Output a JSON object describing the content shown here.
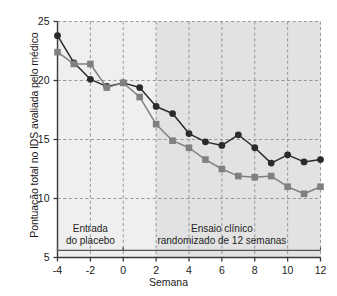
{
  "chart_data": {
    "type": "line",
    "title": "",
    "xlabel": "Semana",
    "ylabel": "Pontuação total no IDS avaliada pelo médico",
    "x": [
      -4,
      -3,
      -2,
      -1,
      0,
      1,
      2,
      3,
      4,
      5,
      6,
      7,
      8,
      9,
      10,
      11,
      12
    ],
    "xlim": [
      -4,
      12
    ],
    "ylim": [
      5,
      25
    ],
    "xticks": [
      "-4",
      "-2",
      "0",
      "2",
      "4",
      "6",
      "8",
      "10",
      "12"
    ],
    "xtick_values": [
      -4,
      -2,
      0,
      2,
      4,
      6,
      8,
      10,
      12
    ],
    "yticks": [
      "5",
      "10",
      "15",
      "20",
      "25"
    ],
    "ytick_values": [
      5,
      10,
      15,
      20,
      25
    ],
    "grid": true,
    "legend_position": "none",
    "series": [
      {
        "name": "circle-series",
        "marker": "circle",
        "color": "#2b2b2b",
        "values": [
          23.8,
          21.5,
          20.1,
          19.5,
          19.8,
          19.4,
          17.8,
          17.2,
          15.5,
          14.8,
          14.5,
          15.4,
          14.3,
          13.0,
          13.7,
          13.1,
          13.3
        ]
      },
      {
        "name": "square-series",
        "marker": "square",
        "color": "#808080",
        "values": [
          22.4,
          21.4,
          21.4,
          19.4,
          19.8,
          18.6,
          16.3,
          14.9,
          14.3,
          13.3,
          12.5,
          11.9,
          11.8,
          11.9,
          11.0,
          10.4,
          11.0
        ]
      }
    ],
    "annotations": [
      {
        "name": "placebo-lead-in",
        "lines": [
          "Entrada",
          "do placebo"
        ],
        "x_center": -2.0,
        "y_center": 7.4,
        "span_start": -4,
        "span_end": 0
      },
      {
        "name": "randomized-trial",
        "lines": [
          "Ensaio clínico",
          "randomizado de 12 semanas"
        ],
        "x_center": 6.0,
        "y_center": 7.4,
        "span_start": 0,
        "span_end": 12
      }
    ],
    "shaded_regions": [
      {
        "name": "light-band",
        "x_start": -4,
        "x_end": 2,
        "color": "#efefef"
      },
      {
        "name": "dark-band",
        "x_start": 2,
        "x_end": 12,
        "color": "#e2e2e2"
      }
    ]
  }
}
